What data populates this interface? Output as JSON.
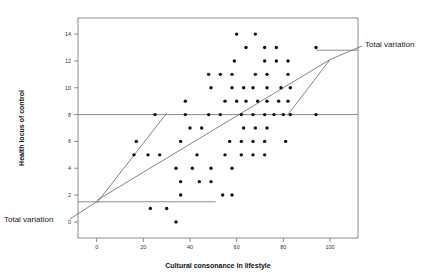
{
  "figure": {
    "title": "",
    "background_color": "#ffffff",
    "frame_color": "#808080",
    "point_color": "#111111",
    "line_color": "#666666"
  },
  "annotations": [
    {
      "id": "total-variation-upper",
      "text": "Total variation",
      "x": 365,
      "y": 40
    },
    {
      "id": "total-variation-lower",
      "text": "Total variation",
      "x": 4,
      "y": 215
    }
  ],
  "chart_data": {
    "type": "scatter",
    "title": "",
    "xlabel": "Cultural consonance in lifestyle",
    "ylabel": "Health locus of control",
    "xlim": [
      -8,
      112
    ],
    "ylim": [
      -1.2,
      15.2
    ],
    "xticks": [
      0,
      20,
      40,
      60,
      80,
      100
    ],
    "yticks": [
      0,
      2,
      4,
      6,
      8,
      10,
      12,
      14
    ],
    "xtick_labels": [
      "0",
      "20",
      "40",
      "60",
      "80",
      "100"
    ],
    "ytick_labels": [
      "0",
      "2",
      "4",
      "6",
      "8",
      "10",
      "12",
      "14"
    ],
    "grid": false,
    "legend": null,
    "reference_lines": [
      {
        "name": "mean-health-locus-hline",
        "orientation": "horizontal",
        "y": 8,
        "x_start": -8,
        "x_end": 112
      },
      {
        "name": "lower-annotation-leader",
        "orientation": "horizontal",
        "y": 1.5,
        "x_start": -8,
        "x_end": 51
      },
      {
        "name": "upper-annotation-leader",
        "orientation": "horizontal",
        "y": 12.8,
        "x_start": 94,
        "x_end": 112
      }
    ],
    "trend_lines": [
      {
        "name": "regression-line-steep",
        "x1": 0,
        "y1": 1.4,
        "x2": 30,
        "y2": 8.1
      },
      {
        "name": "regression-line-overall",
        "x1": 0,
        "y1": 1.6,
        "x2": 100,
        "y2": 12.1
      },
      {
        "name": "variation-segment-right",
        "x1": 82,
        "y1": 8.0,
        "x2": 100,
        "y2": 12.1
      }
    ],
    "points": [
      [
        60,
        14
      ],
      [
        68,
        14
      ],
      [
        64,
        13
      ],
      [
        72,
        13
      ],
      [
        77,
        13
      ],
      [
        94,
        13
      ],
      [
        59,
        12
      ],
      [
        72,
        12
      ],
      [
        77,
        12
      ],
      [
        82,
        12
      ],
      [
        48,
        11
      ],
      [
        53,
        11
      ],
      [
        58,
        11
      ],
      [
        68,
        11
      ],
      [
        73,
        11
      ],
      [
        82,
        11
      ],
      [
        49,
        10
      ],
      [
        58,
        10
      ],
      [
        63,
        10
      ],
      [
        67,
        10
      ],
      [
        73,
        10
      ],
      [
        79,
        10
      ],
      [
        83,
        10
      ],
      [
        38,
        9
      ],
      [
        55,
        9
      ],
      [
        60,
        9
      ],
      [
        64,
        9
      ],
      [
        69,
        9
      ],
      [
        73,
        9
      ],
      [
        78,
        9
      ],
      [
        82,
        9
      ],
      [
        25,
        8
      ],
      [
        38,
        8
      ],
      [
        48,
        8
      ],
      [
        53,
        8
      ],
      [
        62,
        8
      ],
      [
        67,
        8
      ],
      [
        72,
        8
      ],
      [
        76,
        8
      ],
      [
        80,
        8
      ],
      [
        83,
        8
      ],
      [
        94,
        8
      ],
      [
        40,
        7
      ],
      [
        45,
        7
      ],
      [
        63,
        7
      ],
      [
        68,
        7
      ],
      [
        73,
        7
      ],
      [
        17,
        6
      ],
      [
        36,
        6
      ],
      [
        57,
        6
      ],
      [
        62,
        6
      ],
      [
        67,
        6
      ],
      [
        72,
        6
      ],
      [
        81,
        6
      ],
      [
        16,
        5
      ],
      [
        22,
        5
      ],
      [
        27,
        5
      ],
      [
        43,
        5
      ],
      [
        55,
        5
      ],
      [
        62,
        5
      ],
      [
        67,
        5
      ],
      [
        72,
        5
      ],
      [
        34,
        4
      ],
      [
        41,
        4
      ],
      [
        49,
        4
      ],
      [
        58,
        4
      ],
      [
        36,
        3
      ],
      [
        44,
        3
      ],
      [
        49,
        3
      ],
      [
        36,
        2
      ],
      [
        54,
        2
      ],
      [
        58,
        2
      ],
      [
        23,
        1
      ],
      [
        30,
        1
      ],
      [
        34,
        0
      ]
    ]
  }
}
